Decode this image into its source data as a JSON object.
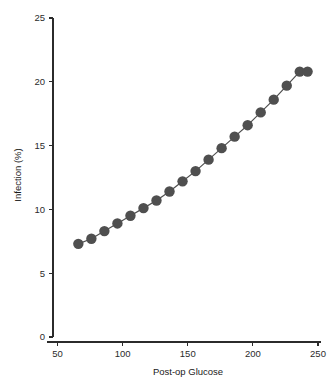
{
  "chart_data": {
    "type": "line",
    "title": "",
    "subtitle": "",
    "xlabel": "Post-op Glucose",
    "ylabel": "Infection (%)",
    "xlim": [
      40,
      258
    ],
    "ylim": [
      0,
      25
    ],
    "xticks": [
      50,
      100,
      150,
      200,
      250
    ],
    "xtick_labels": [
      "50",
      "100",
      "150",
      "200",
      "250"
    ],
    "yticks": [
      0,
      5,
      10,
      15,
      20,
      25
    ],
    "ytick_labels": [
      "0",
      "5",
      "10",
      "15",
      "20",
      "25"
    ],
    "grid": false,
    "legend": null,
    "marker": "circle",
    "marker_color": "#4f4f4f",
    "line_color": "#4f4f4f",
    "line_width": 1.2,
    "marker_size": 5.2,
    "background": "#ffffff",
    "axis_color": "#2b2b2b",
    "series": [
      {
        "name": "Infection rate",
        "x": [
          66,
          76,
          86,
          96,
          106,
          116,
          126,
          136,
          146,
          156,
          166,
          176,
          186,
          196,
          206,
          216,
          226,
          236,
          242
        ],
        "values": [
          7.3,
          7.7,
          8.3,
          8.9,
          9.5,
          10.1,
          10.7,
          11.4,
          12.2,
          13.0,
          13.9,
          14.8,
          15.7,
          16.6,
          17.6,
          18.6,
          19.7,
          20.8,
          20.8
        ]
      }
    ],
    "points": [
      {
        "x": 66,
        "y": 7.3
      },
      {
        "x": 76,
        "y": 7.7
      },
      {
        "x": 86,
        "y": 8.3
      },
      {
        "x": 96,
        "y": 8.9
      },
      {
        "x": 106,
        "y": 9.5
      },
      {
        "x": 116,
        "y": 10.1
      },
      {
        "x": 126,
        "y": 10.7
      },
      {
        "x": 136,
        "y": 11.4
      },
      {
        "x": 146,
        "y": 12.2
      },
      {
        "x": 156,
        "y": 13.0
      },
      {
        "x": 166,
        "y": 13.9
      },
      {
        "x": 176,
        "y": 14.8
      },
      {
        "x": 186,
        "y": 15.7
      },
      {
        "x": 196,
        "y": 16.6
      },
      {
        "x": 206,
        "y": 17.6
      },
      {
        "x": 216,
        "y": 18.6
      },
      {
        "x": 226,
        "y": 19.7
      },
      {
        "x": 236,
        "y": 20.8
      },
      {
        "x": 242,
        "y": 20.8
      }
    ]
  }
}
